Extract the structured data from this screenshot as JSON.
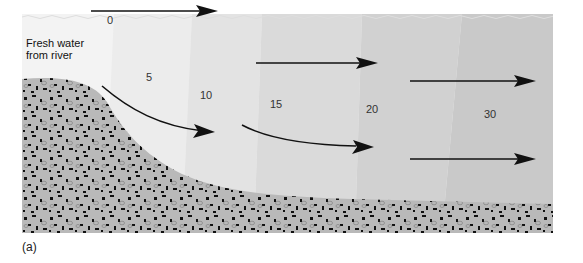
{
  "diagram": {
    "source_label": "Fresh water from river",
    "source_label_lines": [
      "Fresh water",
      "from river"
    ],
    "salinity_labels": [
      {
        "value": "0",
        "x": 107,
        "y": 20
      },
      {
        "value": "5",
        "x": 146,
        "y": 77
      },
      {
        "value": "10",
        "x": 200,
        "y": 95
      },
      {
        "value": "15",
        "x": 270,
        "y": 104
      },
      {
        "value": "20",
        "x": 366,
        "y": 109
      },
      {
        "value": "30",
        "x": 484,
        "y": 113
      }
    ],
    "colors": {
      "water_light": "#f3f3f3",
      "water_dark": "#c9c9c9",
      "sediment": "#b9b9b9",
      "grain": "#111111",
      "arrow": "#111111"
    },
    "caption": "(a)"
  }
}
